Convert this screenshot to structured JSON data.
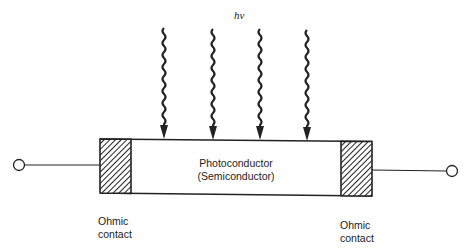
{
  "diagram": {
    "type": "photoconductor-schematic",
    "incident_light_label": "hν",
    "light_rays": [
      {
        "id": "ray-1",
        "x": 164
      },
      {
        "id": "ray-2",
        "x": 213
      },
      {
        "id": "ray-3",
        "x": 260
      },
      {
        "id": "ray-4",
        "x": 307
      }
    ],
    "body": {
      "line1": "Photoconductor",
      "line2": "(Semiconductor)"
    },
    "contacts": {
      "left": {
        "line1": "Ohmic",
        "line2": "contact"
      },
      "right": {
        "line1": "Ohmic",
        "line2": "contact"
      }
    },
    "terminals": [
      "left-terminal",
      "right-terminal"
    ],
    "colors": {
      "stroke": "#222222",
      "background": "#ffffff"
    }
  }
}
